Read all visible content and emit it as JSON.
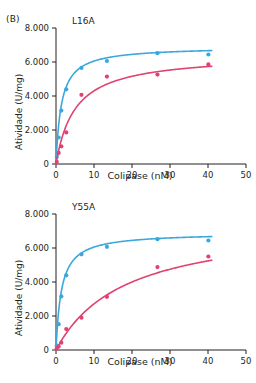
{
  "figure": {
    "panel_tag": "(B)"
  },
  "chart_data": [
    {
      "type": "scatter",
      "title": "L16A",
      "xlabel": "Colipase (nM)",
      "ylabel": "Atividade (U/mg)",
      "xlim": [
        0,
        50
      ],
      "ylim": [
        0,
        8000
      ],
      "xticks": [
        0,
        10,
        20,
        30,
        40,
        50
      ],
      "yticks": [
        0,
        2000,
        4000,
        6000,
        8000
      ],
      "xticklabels": [
        "0",
        "10",
        "20",
        "30",
        "40",
        "50"
      ],
      "yticklabels": [
        "0",
        "2.000",
        "4.000",
        "6.000",
        "8.000"
      ],
      "grid": false,
      "legend": "none",
      "series": [
        {
          "name": "wild-type",
          "color": "#3ba8dd",
          "vmax": 6900,
          "km": 1.4,
          "x": [
            0.2,
            0.7,
            1.4,
            2.7,
            6.7,
            13.4,
            26.7,
            40.1
          ],
          "y": [
            420,
            1560,
            3140,
            4390,
            5650,
            6060,
            6520,
            6440
          ]
        },
        {
          "name": "mutant",
          "color": "#e0436f",
          "vmax": 6450,
          "km": 5.0,
          "x": [
            0.2,
            0.7,
            1.4,
            2.7,
            6.7,
            13.4,
            26.7,
            40.1
          ],
          "y": [
            120,
            650,
            1040,
            1860,
            4070,
            5140,
            5260,
            5860
          ]
        }
      ]
    },
    {
      "type": "scatter",
      "title": "Y55A",
      "xlabel": "Colipase (nM)",
      "ylabel": "Atividade (U/mg)",
      "xlim": [
        0,
        50
      ],
      "ylim": [
        0,
        8000
      ],
      "xticks": [
        0,
        10,
        20,
        30,
        40,
        50
      ],
      "yticks": [
        0,
        2000,
        4000,
        6000,
        8000
      ],
      "xticklabels": [
        "0",
        "10",
        "20",
        "30",
        "40",
        "50"
      ],
      "yticklabels": [
        "0",
        "2.000",
        "4.000",
        "6.000",
        "8.000"
      ],
      "grid": false,
      "legend": "none",
      "series": [
        {
          "name": "wild-type",
          "color": "#3ba8dd",
          "vmax": 6900,
          "km": 1.4,
          "x": [
            0.2,
            0.7,
            1.4,
            2.7,
            6.7,
            13.4,
            26.7,
            40.1
          ],
          "y": [
            260,
            1520,
            3150,
            4390,
            5630,
            6070,
            6520,
            6440
          ]
        },
        {
          "name": "mutant",
          "color": "#e0436f",
          "vmax": 7600,
          "km": 18.0,
          "x": [
            0.2,
            0.7,
            1.4,
            2.7,
            6.7,
            13.4,
            26.7,
            40.1
          ],
          "y": [
            90,
            200,
            430,
            1230,
            1900,
            3130,
            4880,
            5500
          ]
        }
      ]
    }
  ]
}
